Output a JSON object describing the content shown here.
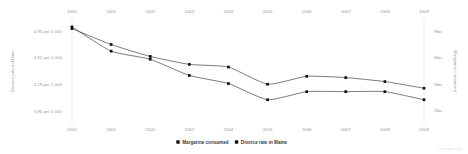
{
  "chart_data": {
    "type": "line",
    "title": "",
    "subtitle": "",
    "xlabel": "",
    "x": [
      2000,
      2001,
      2002,
      2003,
      2004,
      2005,
      2006,
      2007,
      2008,
      2009
    ],
    "x_tick_labels": [
      "2000",
      "2001",
      "2002",
      "2003",
      "2004",
      "2005",
      "2006",
      "2007",
      "2008",
      "2009"
    ],
    "x_axis_position": "both",
    "grid": false,
    "legend_position": "bottom",
    "series": [
      {
        "name": "Margarine consumed",
        "axis": "right",
        "unit": "lbs",
        "color": "#2b2b2b",
        "marker": "square",
        "values": [
          8.2,
          7.0,
          6.1,
          5.5,
          5.3,
          4.0,
          4.6,
          4.5,
          4.2,
          3.7
        ]
      },
      {
        "name": "Divorce rate in Maine",
        "axis": "left",
        "unit": "per 1,000",
        "color": "#2b2b2b",
        "marker": "square",
        "values": [
          5.0,
          4.7,
          4.6,
          4.4,
          4.3,
          4.1,
          4.2,
          4.2,
          4.2,
          4.1
        ]
      }
    ],
    "left_axis": {
      "label": "Divorce rate in Maine",
      "tick_labels": [
        "4.95 per 1,000",
        "4.62 per 1,000",
        "4.29 per 1,000",
        "3.96 per 1,000"
      ],
      "tick_values": [
        4.95,
        4.62,
        4.29,
        3.96
      ],
      "ylim": [
        3.85,
        5.06
      ]
    },
    "right_axis": {
      "label": "Margarine consumed",
      "tick_labels": [
        "8lbs",
        "6lbs",
        "4lbs",
        "2lbs"
      ],
      "tick_values": [
        8,
        6,
        4,
        2
      ],
      "ylim": [
        1.3,
        8.7
      ]
    },
    "legend": [
      {
        "label": "Margarine consumed",
        "marker": "square",
        "color": "#2b2b2b"
      },
      {
        "label": "Divorce rate in Maine",
        "marker": "square",
        "color": "#2b2b2b"
      }
    ]
  },
  "watermark": {
    "text": "tylervigen.com"
  }
}
